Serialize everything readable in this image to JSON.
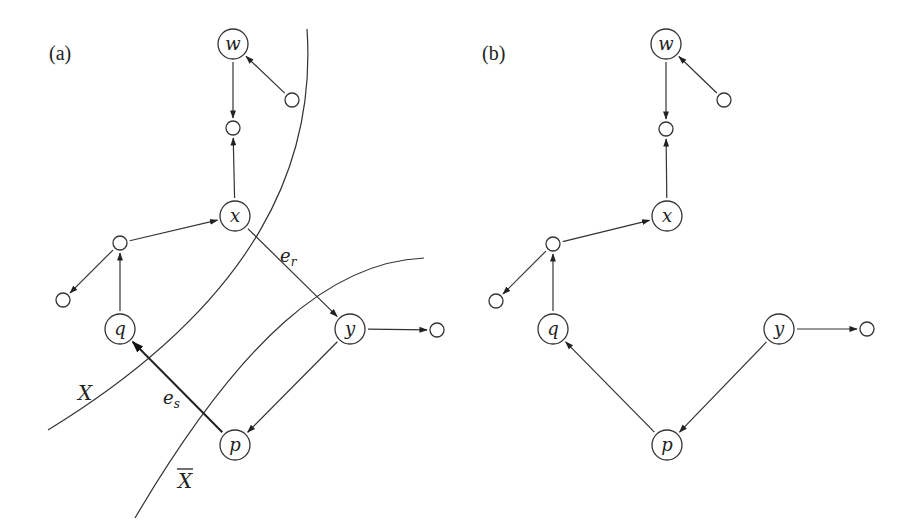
{
  "figure": {
    "panels": [
      {
        "id": "a",
        "label": "(a)",
        "label_pos": [
          49,
          60
        ],
        "nodes": [
          {
            "id": "w",
            "label": "w",
            "x": 233,
            "y": 44,
            "r": 15
          },
          {
            "id": "n_wtop",
            "label": "",
            "x": 292,
            "y": 100,
            "r": 7
          },
          {
            "id": "n_mid",
            "label": "",
            "x": 233,
            "y": 128,
            "r": 7
          },
          {
            "id": "x",
            "label": "x",
            "x": 235,
            "y": 216,
            "r": 15
          },
          {
            "id": "n_left",
            "label": "",
            "x": 120,
            "y": 243,
            "r": 7
          },
          {
            "id": "n_farleft",
            "label": "",
            "x": 63,
            "y": 300,
            "r": 7
          },
          {
            "id": "q",
            "label": "q",
            "x": 120,
            "y": 329,
            "r": 15
          },
          {
            "id": "y",
            "label": "y",
            "x": 350,
            "y": 329,
            "r": 15
          },
          {
            "id": "n_right",
            "label": "",
            "x": 437,
            "y": 330,
            "r": 7
          },
          {
            "id": "p",
            "label": "p",
            "x": 235,
            "y": 445,
            "r": 15
          }
        ],
        "edges": [
          {
            "from": "n_wtop",
            "to": "w"
          },
          {
            "from": "w",
            "to": "n_mid"
          },
          {
            "from": "x",
            "to": "n_mid"
          },
          {
            "from": "n_left",
            "to": "x"
          },
          {
            "from": "n_left",
            "to": "n_farleft"
          },
          {
            "from": "q",
            "to": "n_left"
          },
          {
            "from": "x",
            "to": "y",
            "label": "e_r",
            "name": "edge-e-r"
          },
          {
            "from": "y",
            "to": "n_right"
          },
          {
            "from": "y",
            "to": "p"
          },
          {
            "from": "p",
            "to": "q",
            "label": "e_s",
            "name": "edge-e-s",
            "bold": true
          }
        ],
        "edge_labels": [
          {
            "text": "e",
            "sub": "r",
            "x": 280,
            "y": 262
          },
          {
            "text": "e",
            "sub": "s",
            "x": 163,
            "y": 404
          }
        ],
        "cuts": [
          {
            "name": "cut-X",
            "label": "X",
            "label_x": 78,
            "label_y": 400,
            "overline": false,
            "path": "M 307 29 C 316 160, 260 300, 48 430"
          },
          {
            "name": "cut-X-bar",
            "label": "X",
            "label_x": 178,
            "label_y": 488,
            "overline": true,
            "path": "M 424 258 C 330 262, 240 340, 135 518"
          }
        ]
      },
      {
        "id": "b",
        "label": "(b)",
        "label_pos": [
          482,
          60
        ],
        "nodes": [
          {
            "id": "w",
            "label": "w",
            "x": 666,
            "y": 44,
            "r": 15
          },
          {
            "id": "n_wtop",
            "label": "",
            "x": 724,
            "y": 100,
            "r": 7
          },
          {
            "id": "n_mid",
            "label": "",
            "x": 666,
            "y": 129,
            "r": 7
          },
          {
            "id": "x",
            "label": "x",
            "x": 667,
            "y": 216,
            "r": 15
          },
          {
            "id": "n_left",
            "label": "",
            "x": 553,
            "y": 244,
            "r": 7
          },
          {
            "id": "n_farleft",
            "label": "",
            "x": 496,
            "y": 301,
            "r": 7
          },
          {
            "id": "q",
            "label": "q",
            "x": 553,
            "y": 329,
            "r": 15
          },
          {
            "id": "y",
            "label": "y",
            "x": 779,
            "y": 329,
            "r": 15
          },
          {
            "id": "n_right",
            "label": "",
            "x": 867,
            "y": 329,
            "r": 7
          },
          {
            "id": "p",
            "label": "p",
            "x": 667,
            "y": 445,
            "r": 15
          }
        ],
        "edges": [
          {
            "from": "n_wtop",
            "to": "w"
          },
          {
            "from": "w",
            "to": "n_mid"
          },
          {
            "from": "x",
            "to": "n_mid"
          },
          {
            "from": "n_left",
            "to": "x"
          },
          {
            "from": "n_left",
            "to": "n_farleft"
          },
          {
            "from": "q",
            "to": "n_left"
          },
          {
            "from": "y",
            "to": "n_right"
          },
          {
            "from": "y",
            "to": "p"
          },
          {
            "from": "p",
            "to": "q"
          }
        ],
        "edge_labels": [],
        "cuts": []
      }
    ],
    "colors": {
      "stroke": "#333333",
      "text": "#222222",
      "background": "#ffffff"
    }
  }
}
